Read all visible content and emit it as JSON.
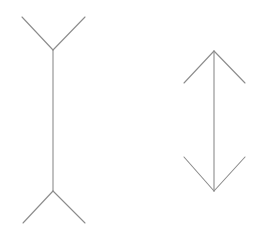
{
  "diagram": {
    "type": "muller-lyer-illusion",
    "background": "#ffffff",
    "line_color": "#8c8c8c",
    "figures": [
      {
        "name": "fins-out-figure",
        "shaft": {
          "x1": 53,
          "y1": 50,
          "x2": 53,
          "y2": 191
        },
        "fins": [
          {
            "x1": 22,
            "y1": 17,
            "x2": 53,
            "y2": 50
          },
          {
            "x1": 85,
            "y1": 17,
            "x2": 53,
            "y2": 50
          },
          {
            "x1": 53,
            "y1": 191,
            "x2": 23,
            "y2": 223
          },
          {
            "x1": 53,
            "y1": 191,
            "x2": 85,
            "y2": 223
          }
        ]
      },
      {
        "name": "fins-in-figure",
        "shaft": {
          "x1": 214,
          "y1": 51,
          "x2": 214,
          "y2": 191
        },
        "fins": [
          {
            "x1": 214,
            "y1": 51,
            "x2": 184,
            "y2": 83
          },
          {
            "x1": 214,
            "y1": 51,
            "x2": 245,
            "y2": 83
          },
          {
            "x1": 184,
            "y1": 157,
            "x2": 214,
            "y2": 191
          },
          {
            "x1": 245,
            "y1": 157,
            "x2": 214,
            "y2": 191
          }
        ]
      }
    ]
  }
}
